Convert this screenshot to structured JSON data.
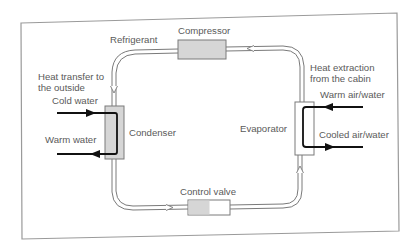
{
  "diagram": {
    "colors": {
      "frame": "#9a9a9a",
      "pipe_outline": "#7a7a7a",
      "component_fill": "#d6d6d6",
      "component_stroke": "#7a7a7a",
      "arrow": "#111111",
      "text": "#5a5a5a"
    },
    "components": {
      "compressor": {
        "label": "Compressor"
      },
      "condenser": {
        "label": "Condenser"
      },
      "evaporator": {
        "label": "Evaporator"
      },
      "control_valve": {
        "label": "Control valve"
      }
    },
    "labels": {
      "refrigerant": "Refrigerant",
      "heat_transfer_line1": "Heat transfer to",
      "heat_transfer_line2": "the outside",
      "heat_extraction_line1": "Heat extraction",
      "heat_extraction_line2": "from the cabin",
      "cold_water": "Cold water",
      "warm_water": "Warm water",
      "warm_air_water": "Warm air/water",
      "cooled_air_water": "Cooled air/water"
    },
    "flows": [
      {
        "from": "compressor",
        "to": "condenser",
        "medium": "Refrigerant"
      },
      {
        "from": "condenser",
        "to": "control_valve",
        "medium": "Refrigerant"
      },
      {
        "from": "control_valve",
        "to": "evaporator",
        "medium": "Refrigerant"
      },
      {
        "from": "evaporator",
        "to": "compressor",
        "medium": "Refrigerant"
      },
      {
        "into": "condenser",
        "medium": "Cold water"
      },
      {
        "outof": "condenser",
        "medium": "Warm water"
      },
      {
        "into": "evaporator",
        "medium": "Warm air/water"
      },
      {
        "outof": "evaporator",
        "medium": "Cooled air/water"
      }
    ]
  }
}
